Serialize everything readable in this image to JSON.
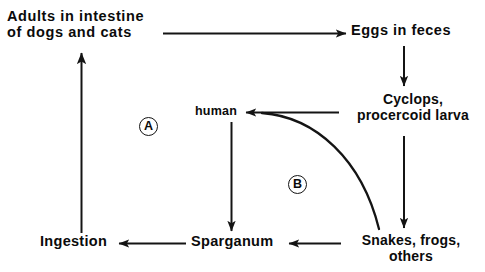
{
  "diagram": {
    "type": "flow-diagram",
    "background_color": "#ffffff",
    "line_color": "#141414",
    "text_color": "#0b0b0b",
    "nodes": {
      "adults": {
        "line1": "Adults in intestine",
        "line2": "of dogs and cats"
      },
      "eggs": {
        "line1": "Eggs in feces"
      },
      "cyclops": {
        "line1": "Cyclops,",
        "line2": "procercoid larva"
      },
      "human": {
        "line1": "human"
      },
      "snakes": {
        "line1": "Snakes, frogs,",
        "line2": "others"
      },
      "sparganum": {
        "line1": "Sparganum"
      },
      "ingestion": {
        "line1": "Ingestion"
      }
    },
    "markers": {
      "cycle_a": "A",
      "cycle_b": "B"
    },
    "edges": [
      {
        "from": "adults",
        "to": "eggs",
        "style": "straight-arrow",
        "direction": "right"
      },
      {
        "from": "eggs",
        "to": "cyclops",
        "style": "straight-arrow",
        "direction": "down"
      },
      {
        "from": "cyclops",
        "to": "snakes",
        "style": "straight-arrow",
        "direction": "down"
      },
      {
        "from": "cyclops",
        "to": "human",
        "style": "straight-arrow",
        "direction": "left"
      },
      {
        "from": "cyclops",
        "to": "snakes",
        "style": "curved-line",
        "direction": "down-right"
      },
      {
        "from": "snakes",
        "to": "sparganum",
        "style": "straight-arrow",
        "direction": "left"
      },
      {
        "from": "human",
        "to": "sparganum",
        "style": "straight-arrow",
        "direction": "down"
      },
      {
        "from": "sparganum",
        "to": "ingestion",
        "style": "straight-arrow",
        "direction": "left"
      },
      {
        "from": "ingestion",
        "to": "adults",
        "style": "straight-arrow",
        "direction": "up"
      }
    ]
  }
}
